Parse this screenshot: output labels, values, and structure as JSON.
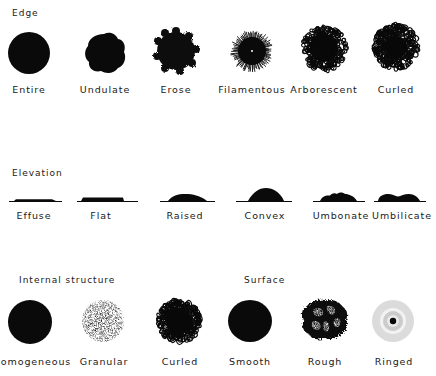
{
  "sections": {
    "edge": {
      "title": "Edge",
      "items": [
        {
          "label": "Entire",
          "shape": "entire"
        },
        {
          "label": "Undulate",
          "shape": "undulate"
        },
        {
          "label": "Erose",
          "shape": "erose"
        },
        {
          "label": "Filamentous",
          "shape": "filamentous"
        },
        {
          "label": "Arborescent",
          "shape": "arborescent"
        },
        {
          "label": "Curled",
          "shape": "curled"
        }
      ]
    },
    "elevation": {
      "title": "Elevation",
      "items": [
        {
          "label": "Effuse",
          "shape": "effuse"
        },
        {
          "label": "Flat",
          "shape": "flat"
        },
        {
          "label": "Raised",
          "shape": "raised"
        },
        {
          "label": "Convex",
          "shape": "convex"
        },
        {
          "label": "Umbonate",
          "shape": "umbonate"
        },
        {
          "label": "Umbilicate",
          "shape": "umbilicate"
        }
      ]
    },
    "internal_structure": {
      "title": "Internal structure",
      "items": [
        {
          "label": "Homogeneous",
          "shape": "homogeneous"
        },
        {
          "label": "Granular",
          "shape": "granular"
        },
        {
          "label": "Curled",
          "shape": "curled-internal"
        }
      ]
    },
    "surface": {
      "title": "Surface",
      "items": [
        {
          "label": "Smooth",
          "shape": "smooth"
        },
        {
          "label": "Rough",
          "shape": "rough"
        },
        {
          "label": "Ringed",
          "shape": "ringed"
        }
      ]
    }
  },
  "colors": {
    "ink": "#0a0a0a",
    "paper": "#ffffff"
  }
}
